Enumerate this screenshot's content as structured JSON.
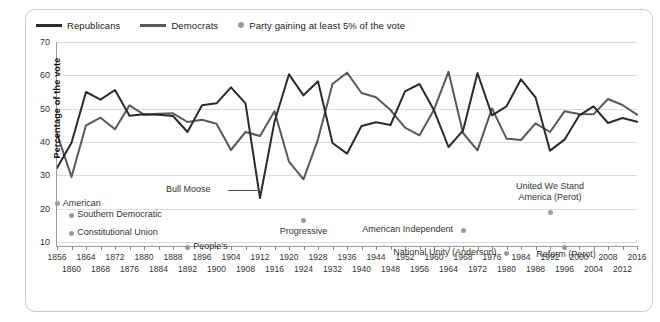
{
  "legend": {
    "items": [
      {
        "label": "Republicans",
        "icon": "line-swatch",
        "color": "#2b2b2b",
        "type": "line"
      },
      {
        "label": "Democrats",
        "icon": "line-swatch",
        "color": "#595959",
        "type": "line"
      },
      {
        "label": "Party gaining at least 5% of the vote",
        "icon": "dot-swatch",
        "color": "#9b9b9b",
        "type": "dot"
      }
    ]
  },
  "axes": {
    "ylabel": "Percentage of the vote",
    "yticks": [
      70,
      60,
      50,
      40,
      30,
      20,
      10
    ],
    "ylim": [
      3,
      70
    ],
    "xticks_row1": [
      1856,
      1864,
      1872,
      1880,
      1888,
      1896,
      1904,
      1912,
      1920,
      1928,
      1936,
      1944,
      1952,
      1960,
      1968,
      1976,
      1984,
      1992,
      2000,
      2008,
      2016
    ],
    "xticks_row2": [
      1860,
      1868,
      1876,
      1884,
      1892,
      1900,
      1908,
      1916,
      1924,
      1932,
      1940,
      1948,
      1956,
      1964,
      1972,
      1980,
      1988,
      1996,
      2004,
      2012
    ]
  },
  "annotations": [
    {
      "name": "bull-moose",
      "label": "Bull Moose",
      "x": 1912,
      "y": 23.0,
      "text_x": 1896,
      "text_y": 25.5,
      "has_leader": true,
      "dot": false
    },
    {
      "name": "american",
      "label": "American",
      "x": 1856,
      "y": 21.5,
      "text_x": 1857.6,
      "text_y": 21.5,
      "dot": true,
      "dot_side": "left"
    },
    {
      "name": "southern-democratic",
      "label": "Southern Democratic",
      "x": 1860,
      "y": 18.1,
      "text_x": 1861.6,
      "text_y": 18.1,
      "dot": true,
      "dot_side": "left"
    },
    {
      "name": "constitutional-union",
      "label": "Constitutional Union",
      "x": 1860,
      "y": 12.6,
      "text_x": 1861.6,
      "text_y": 12.6,
      "dot": true,
      "dot_side": "left"
    },
    {
      "name": "peoples",
      "label": "People's",
      "x": 1892,
      "y": 8.5,
      "text_x": 1893.6,
      "text_y": 8.5,
      "dot": true,
      "dot_side": "left"
    },
    {
      "name": "progressive",
      "label": "Progressive",
      "x": 1924,
      "y": 16.6,
      "text_x": 1924,
      "text_y": 13.0,
      "dot": true,
      "dot_side": "above"
    },
    {
      "name": "american-independent",
      "label": "American Independent",
      "x": 1968,
      "y": 13.5,
      "text_x": 1966.6,
      "text_y": 13.5,
      "dot": true,
      "dot_side": "right"
    },
    {
      "name": "national-unity-anderson",
      "label": "National Unity (Anderson)",
      "x": 1980,
      "y": 6.6,
      "text_x": 1978.6,
      "text_y": 6.6,
      "dot": true,
      "dot_side": "right"
    },
    {
      "name": "united-we-stand-america-perot",
      "label": "United We Stand\nAmerica (Perot)",
      "x": 1992,
      "y": 18.9,
      "text_x": 1992,
      "text_y": 25.0,
      "dot": true,
      "dot_side": "above"
    },
    {
      "name": "reform-perot",
      "label": "Reform (Perot)",
      "x": 1996,
      "y": 8.4,
      "text_x": 1996.4,
      "text_y": 6.2,
      "dot": true,
      "dot_side": "above"
    }
  ],
  "chart_data": {
    "type": "line",
    "title": "",
    "subtitle": "",
    "xlabel": "",
    "ylabel": "Percentage of the vote",
    "ylim": [
      3,
      70
    ],
    "xlim": [
      1856,
      2016
    ],
    "grid": true,
    "legend_position": "top-left",
    "x": [
      1856,
      1860,
      1864,
      1868,
      1872,
      1876,
      1880,
      1884,
      1888,
      1892,
      1896,
      1900,
      1904,
      1908,
      1912,
      1916,
      1920,
      1924,
      1928,
      1932,
      1936,
      1940,
      1944,
      1948,
      1952,
      1956,
      1960,
      1964,
      1968,
      1972,
      1976,
      1980,
      1984,
      1988,
      1992,
      1996,
      2000,
      2004,
      2008,
      2012,
      2016
    ],
    "series": [
      {
        "name": "Republicans",
        "color": "#2b2b2b",
        "values": [
          32.2,
          39.8,
          55.0,
          52.7,
          55.6,
          47.9,
          48.3,
          48.2,
          47.8,
          43.0,
          51.0,
          51.6,
          56.4,
          51.6,
          23.2,
          46.1,
          60.3,
          54.0,
          58.2,
          39.7,
          36.5,
          44.8,
          45.9,
          45.1,
          55.2,
          57.4,
          49.5,
          38.5,
          43.4,
          60.7,
          48.0,
          50.7,
          58.8,
          53.4,
          37.4,
          40.7,
          47.9,
          50.7,
          45.7,
          47.2,
          46.1
        ]
      },
      {
        "name": "Democrats",
        "color": "#595959",
        "values": [
          42.5,
          29.5,
          45.0,
          47.3,
          43.8,
          51.0,
          48.2,
          48.5,
          48.6,
          46.0,
          46.7,
          45.5,
          37.6,
          43.0,
          41.8,
          49.2,
          34.1,
          28.8,
          40.8,
          57.4,
          60.8,
          54.7,
          53.4,
          49.6,
          44.3,
          42.0,
          49.7,
          61.1,
          42.7,
          37.5,
          50.1,
          41.0,
          40.6,
          45.6,
          43.0,
          49.2,
          48.4,
          48.3,
          52.9,
          51.1,
          48.2
        ]
      }
    ]
  }
}
